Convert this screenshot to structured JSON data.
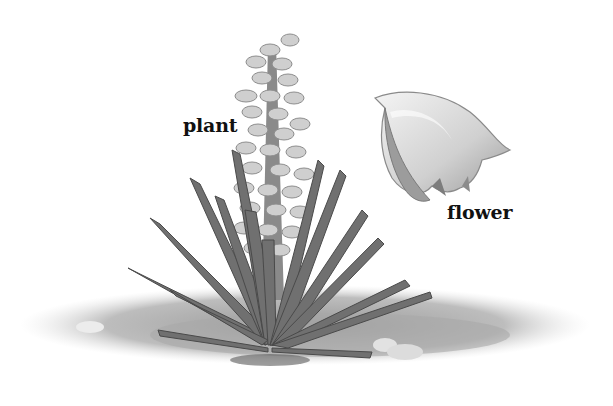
{
  "diagram": {
    "type": "labeled-illustration",
    "labels": [
      {
        "id": "plant",
        "text": "plant"
      },
      {
        "id": "flower",
        "text": "flower"
      }
    ],
    "colors": {
      "background": "#ffffff",
      "leaf": "#6e6e6e",
      "leaf_dark": "#4a4a4a",
      "blossom": "#c9c9c9",
      "ground": "#b8b8b8",
      "text": "#111111"
    }
  }
}
